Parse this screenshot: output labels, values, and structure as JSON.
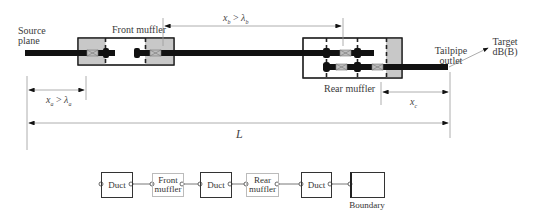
{
  "diagram": {
    "labels": {
      "source_plane": "Source plane",
      "front_muffler": "Front muffler",
      "rear_muffler": "Rear muffler",
      "tailpipe_outlet": "Tailpipe outlet",
      "target": "Target dB(B)"
    },
    "dimensions": {
      "xa": "xₐ > λₐ",
      "xb": "x_b > λ_b",
      "xc": "x_c",
      "L": "L"
    },
    "dimension_parts": {
      "xa_var": "x",
      "xa_sub": "a",
      "xa_lam": "λ",
      "xa_lsub": "a",
      "xb_var": "x",
      "xb_sub": "b",
      "xb_lam": "λ",
      "xb_lsub": "b",
      "xc_var": "x",
      "xc_sub": "c",
      "gt": ">",
      "L": "L"
    },
    "block_chain": [
      {
        "id": "duct-1",
        "label": "Duct",
        "style": "dark"
      },
      {
        "id": "front-muffler",
        "label": "Front muffler",
        "style": "light"
      },
      {
        "id": "duct-2",
        "label": "Duct",
        "style": "dark"
      },
      {
        "id": "rear-muffler",
        "label": "Rear muffler",
        "style": "light"
      },
      {
        "id": "duct-3",
        "label": "Duct",
        "style": "dark"
      },
      {
        "id": "boundary",
        "label": "Boundary",
        "style": "dark"
      }
    ],
    "colors": {
      "pipe": "#111111",
      "chamber_fill": "#c8c8c8",
      "outline": "#222222",
      "dim_line": "#9a9a9a",
      "light_block": "#bbbbbb"
    }
  }
}
